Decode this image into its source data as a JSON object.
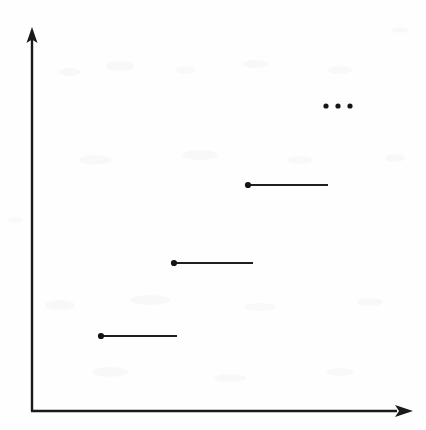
{
  "figure": {
    "title": "",
    "background_color": "#fefefe",
    "ink_color": "#1a1a1a",
    "width": 426,
    "height": 430
  },
  "axes": {
    "origin": {
      "x": 32,
      "y": 411
    },
    "x_axis": {
      "name": "x-axis",
      "from_x": 31,
      "to_x": 404,
      "y": 411,
      "arrow": "right",
      "arrow_tip_x": 413,
      "label": ""
    },
    "y_axis": {
      "name": "y-axis",
      "x": 32,
      "from_y": 411,
      "to_y": 36,
      "arrow": "up",
      "arrow_tip_y": 27,
      "label": ""
    }
  },
  "ellipsis": {
    "name": "continuation-ellipsis",
    "text": "...",
    "dot_count": 3,
    "dot_radius": 2.6,
    "y": 106,
    "dot_x": [
      326,
      338,
      350
    ]
  },
  "chart_data": {
    "type": "line",
    "subtype": "step",
    "title": "",
    "xlabel": "",
    "ylabel": "",
    "xlim": [
      0,
      426
    ],
    "ylim": [
      0,
      430
    ],
    "grid": false,
    "legend": null,
    "annotations": [
      "..."
    ],
    "series": [
      {
        "name": "step-function",
        "closed_endpoint": "left",
        "segments": [
          {
            "index": 1,
            "x_start": 100,
            "x_end": 177,
            "y": 336,
            "left_dot": true,
            "right_dot": false
          },
          {
            "index": 2,
            "x_start": 173,
            "x_end": 253,
            "y": 263,
            "left_dot": true,
            "right_dot": false
          },
          {
            "index": 3,
            "x_start": 247,
            "x_end": 328,
            "y": 185,
            "left_dot": true,
            "right_dot": false
          }
        ]
      }
    ],
    "step_levels_px_y": [
      336,
      263,
      185
    ],
    "step_breakpoints_px_x": [
      100,
      177,
      253,
      328
    ]
  }
}
